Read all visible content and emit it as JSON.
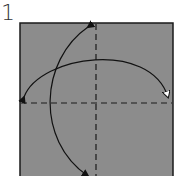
{
  "step": {
    "number": "1"
  },
  "paper": {
    "fill": "#8c8c8c",
    "stroke": "#1a1a1a",
    "x": 20,
    "y": 23,
    "width": 153,
    "height": 160
  },
  "folds": [
    {
      "type": "valley-fold-line",
      "orientation": "vertical",
      "position": 96
    },
    {
      "type": "valley-fold-line",
      "orientation": "horizontal",
      "position": 103
    }
  ],
  "arrows": [
    {
      "name": "fold-and-unfold-horizontal",
      "from": "left-edge",
      "to": "right-edge"
    },
    {
      "name": "fold-and-unfold-vertical",
      "from": "top-edge",
      "to": "bottom-edge"
    }
  ]
}
